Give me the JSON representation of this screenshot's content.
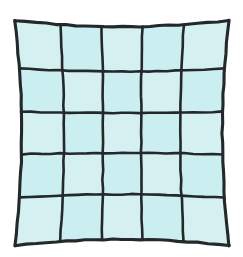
{
  "figure": {
    "name": "barrel-distortion-grid",
    "title": "Barrel distorted square grid",
    "background_color": "#ffffff",
    "canvas": {
      "width": 243,
      "height": 257
    }
  },
  "style": {
    "line_color": "#23282b",
    "line_width": 2.6,
    "outer_line_width": 3.1,
    "cell_fill": "#d4f0f0",
    "cell_fill_alt": "#cbeef0",
    "cell_stroke": "none"
  },
  "chart_data": {
    "type": "heatmap",
    "title": "Barrel distorted square grid",
    "xlabel": "",
    "ylabel": "",
    "rows": 5,
    "cols": 5,
    "grid": true,
    "legend": "none",
    "distortion": {
      "model": "barrel",
      "sign": "negative-radial",
      "k1": -0.085,
      "center_x": 122,
      "center_y": 133
    },
    "undistorted_bounds": {
      "left": 27,
      "top": 33,
      "right": 217,
      "bottom": 233
    },
    "extremes": {
      "left_edge_mid_x": 20,
      "right_edge_mid_x": 224,
      "top_edge_mid_y": 27,
      "bottom_edge_mid_y": 240,
      "corner_top_left": [
        28,
        33
      ],
      "corner_top_right": [
        215,
        35
      ],
      "corner_bottom_left": [
        30,
        231
      ],
      "corner_bottom_right": [
        214,
        228
      ]
    },
    "categories": [
      "c1",
      "c2",
      "c3",
      "c4",
      "c5"
    ],
    "row_labels": [
      "r1",
      "r2",
      "r3",
      "r4",
      "r5"
    ],
    "values": [
      [
        1,
        1,
        1,
        1,
        1
      ],
      [
        1,
        1,
        1,
        1,
        1
      ],
      [
        1,
        1,
        1,
        1,
        1
      ],
      [
        1,
        1,
        1,
        1,
        1
      ],
      [
        1,
        1,
        1,
        1,
        1
      ]
    ],
    "vertical_line_x_at_middle": [
      21,
      62,
      104,
      146,
      185,
      224
    ],
    "horizontal_line_y_at_middle": [
      27,
      70,
      111,
      154,
      198,
      240
    ]
  }
}
